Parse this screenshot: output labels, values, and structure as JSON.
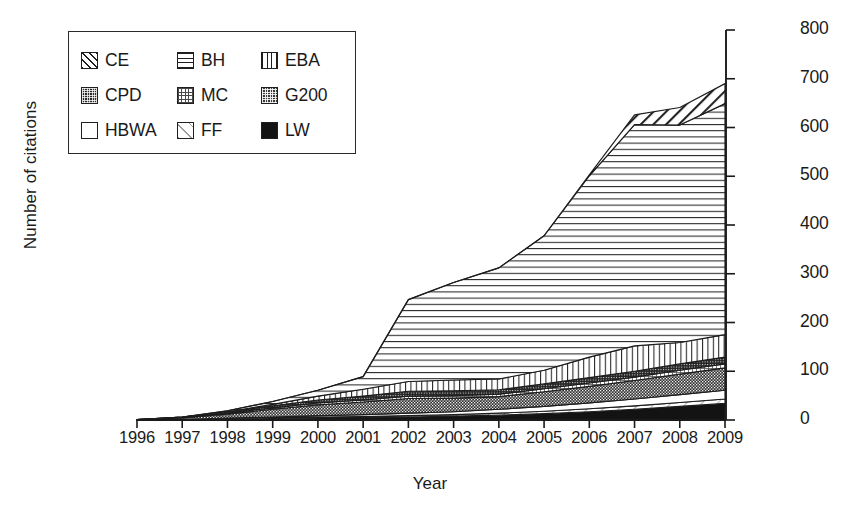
{
  "chart_data": {
    "type": "area",
    "stacked": true,
    "title": "",
    "xlabel": "Year",
    "ylabel": "Number of citations",
    "categories": [
      1996,
      1997,
      1998,
      1999,
      2000,
      2001,
      2002,
      2003,
      2004,
      2005,
      2006,
      2007,
      2008,
      2009
    ],
    "x": [
      "1996",
      "1997",
      "1998",
      "1999",
      "2000",
      "2001",
      "2002",
      "2003",
      "2004",
      "2005",
      "2006",
      "2007",
      "2008",
      "2009"
    ],
    "ylim": [
      0,
      800
    ],
    "yticks": [
      0,
      100,
      200,
      300,
      400,
      500,
      600,
      700,
      800
    ],
    "ytick_labels": [
      "0",
      "100",
      "200",
      "300",
      "400",
      "500",
      "600",
      "700",
      "800"
    ],
    "xticks": [
      "1996",
      "1997",
      "1998",
      "1999",
      "2000",
      "2001",
      "2002",
      "2003",
      "2004",
      "2005",
      "2006",
      "2007",
      "2008",
      "2009"
    ],
    "grid": false,
    "y_axis_position": "right",
    "legend_position": "upper-left",
    "stack_order_bottom_to_top": [
      "LW",
      "FF",
      "HBWA",
      "G200",
      "MC",
      "CPD",
      "EBA",
      "BH",
      "CE"
    ],
    "series": [
      {
        "name": "LW",
        "label": "LW",
        "pattern": "solid-black",
        "color": "#131313",
        "values": [
          0,
          1,
          2,
          3,
          4,
          5,
          6,
          8,
          10,
          13,
          17,
          22,
          28,
          34
        ]
      },
      {
        "name": "FF",
        "label": "FF",
        "pattern": "white-light-diagonal",
        "color": "#ffffff",
        "values": [
          0,
          0,
          1,
          1,
          2,
          2,
          3,
          3,
          4,
          5,
          6,
          7,
          8,
          9
        ]
      },
      {
        "name": "HBWA",
        "label": "HBWA",
        "pattern": "white-empty",
        "color": "#ffffff",
        "values": [
          0,
          0,
          1,
          2,
          3,
          4,
          5,
          6,
          8,
          10,
          12,
          14,
          16,
          18
        ]
      },
      {
        "name": "G200",
        "label": "G200",
        "pattern": "dense-checker-dark",
        "color": "#3a3a3a",
        "values": [
          1,
          3,
          8,
          16,
          22,
          26,
          30,
          28,
          26,
          30,
          34,
          38,
          42,
          46
        ]
      },
      {
        "name": "MC",
        "label": "MC",
        "pattern": "grid-crosshatch-light",
        "color": "#ffffff",
        "values": [
          0,
          1,
          2,
          3,
          4,
          4,
          5,
          5,
          5,
          6,
          7,
          7,
          8,
          8
        ]
      },
      {
        "name": "CPD",
        "label": "CPD",
        "pattern": "dense-dot-dark",
        "color": "#2a2a2a",
        "values": [
          0,
          1,
          2,
          4,
          6,
          8,
          10,
          10,
          9,
          10,
          11,
          12,
          13,
          14
        ]
      },
      {
        "name": "EBA",
        "label": "EBA",
        "pattern": "vertical-lines",
        "color": "#ffffff",
        "values": [
          0,
          0,
          1,
          3,
          8,
          14,
          20,
          22,
          22,
          28,
          42,
          52,
          44,
          46
        ]
      },
      {
        "name": "BH",
        "label": "BH",
        "pattern": "horizontal-lines",
        "color": "#ffffff",
        "values": [
          0,
          0,
          2,
          6,
          12,
          26,
          168,
          200,
          228,
          276,
          372,
          454,
          446,
          474
        ]
      },
      {
        "name": "CE",
        "label": "CE",
        "pattern": "diagonal-hatch",
        "color": "#ffffff",
        "values": [
          0,
          0,
          0,
          0,
          0,
          0,
          0,
          0,
          0,
          0,
          2,
          20,
          36,
          41
        ]
      }
    ],
    "totals": [
      1,
      6,
      19,
      38,
      61,
      89,
      247,
      282,
      312,
      378,
      503,
      626,
      641,
      690
    ]
  },
  "legend": {
    "items": [
      {
        "key": "CE",
        "label": "CE"
      },
      {
        "key": "BH",
        "label": "BH"
      },
      {
        "key": "EBA",
        "label": "EBA"
      },
      {
        "key": "CPD",
        "label": "CPD"
      },
      {
        "key": "MC",
        "label": "MC"
      },
      {
        "key": "G200",
        "label": "G200"
      },
      {
        "key": "HBWA",
        "label": "HBWA"
      },
      {
        "key": "FF",
        "label": "FF"
      },
      {
        "key": "LW",
        "label": "LW"
      }
    ]
  },
  "colors": {
    "axis": "#1a1a1a",
    "text": "#1a1a1a",
    "background": "#ffffff"
  }
}
